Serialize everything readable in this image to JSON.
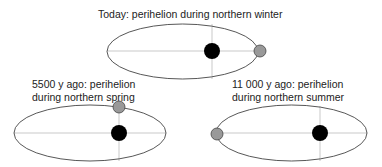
{
  "panels": [
    {
      "title_lines": [
        "Today: perihelion during northern winter"
      ]
    },
    {
      "title_lines": [
        "5500 y ago: perihelion",
        "during northern spring"
      ]
    },
    {
      "title_lines": [
        "11 000 y ago: perihelion",
        "during northern summer"
      ]
    }
  ],
  "colors": {
    "orbit": "#444444",
    "axis": "#bbbbbb",
    "sun": "#000000",
    "earth": "#999999"
  }
}
